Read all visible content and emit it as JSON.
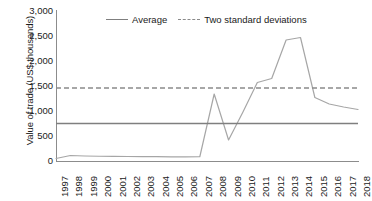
{
  "chart_data": {
    "type": "line",
    "title": "",
    "xlabel": "",
    "ylabel": "Value of trade (US$ thousands)",
    "ylim": [
      0,
      3000
    ],
    "yticks": [
      "0",
      "500",
      "1,000",
      "1,500",
      "2,000",
      "2,500",
      "3,000"
    ],
    "ytick_values": [
      0,
      500,
      1000,
      1500,
      2000,
      2500,
      3000
    ],
    "grid": false,
    "legend_position": "top-center",
    "categories": [
      "1997",
      "1998",
      "1999",
      "2000",
      "2001",
      "2002",
      "2003",
      "2004",
      "2005",
      "2006",
      "2007",
      "2008",
      "2009",
      "2010",
      "2011",
      "2012",
      "2013",
      "2014",
      "2015",
      "2016",
      "2017",
      "2018"
    ],
    "series": [
      {
        "name": "Value of trade",
        "style": "solid",
        "color": "#a6a6a6",
        "values": [
          50,
          110,
          100,
          95,
          92,
          90,
          88,
          86,
          84,
          82,
          85,
          1340,
          420,
          980,
          1570,
          1650,
          2420,
          2470,
          1270,
          1140,
          1080,
          1030
        ]
      },
      {
        "name": "Average",
        "style": "solid-reference",
        "color": "#7f7f7f",
        "value": 750
      },
      {
        "name": "Two standard deviations",
        "style": "dashed-reference",
        "color": "#8a8a8a",
        "value": 1460
      }
    ]
  },
  "legend": {
    "entries": [
      {
        "label": "Average",
        "style": "solid",
        "color": "#7f7f7f"
      },
      {
        "label": "Two standard deviations",
        "style": "dashed",
        "color": "#8a8a8a"
      }
    ]
  },
  "colors": {
    "series_line": "#a6a6a6",
    "average_line": "#7f7f7f",
    "two_sd_line": "#8a8a8a",
    "axis": "#8c8c8c",
    "text": "#1a1a1a",
    "background": "#ffffff"
  }
}
